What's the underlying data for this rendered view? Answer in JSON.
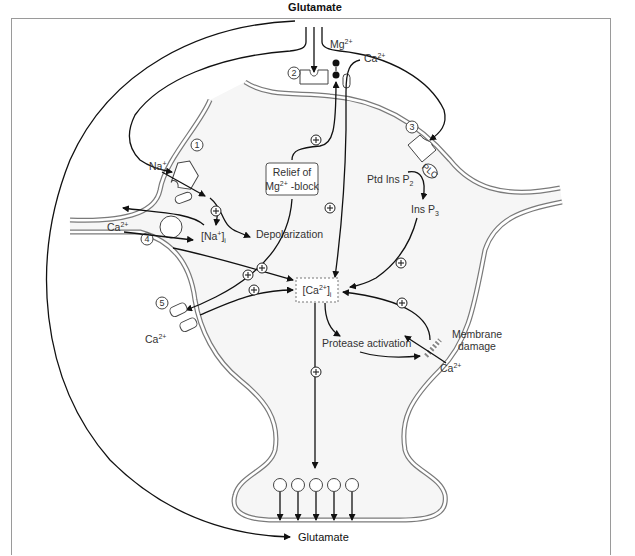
{
  "labels": {
    "glutamate_top": "Glutamate",
    "glutamate_bottom": "Glutamate",
    "mg": "Mg",
    "mg_sup": "2+",
    "ca_top": "Ca",
    "ca_top_sup": "2+",
    "na": "Na",
    "na_sup": "+",
    "relief_line1": "Relief of",
    "relief_line2_a": "Mg",
    "relief_line2_sup": "2+",
    "relief_line2_b": " -block",
    "depolarization": "Depolarization",
    "na_i": "[Na",
    "na_i_sup": "+",
    "na_i_end": "]",
    "na_i_sub": "i",
    "ca_left": "Ca",
    "ca_left_sup": "2+",
    "ca_i": "[Ca",
    "ca_i_sup": "2+",
    "ca_i_end": "]",
    "ca_i_sub": "i",
    "ca_bottom_left": "Ca",
    "ca_bottom_left_sup": "2+",
    "ptd_ins": "Ptd Ins P",
    "ptd_ins_sub": "2",
    "ins_p3": "Ins P",
    "ins_p3_sub": "3",
    "plc": "PLC",
    "protease": "Protease activation",
    "membrane_damage_1": "Membrane",
    "membrane_damage_2": "damage",
    "ca_right": "Ca",
    "ca_right_sup": "2+"
  },
  "receptors": [
    {
      "id": "1",
      "label": "1",
      "name": "AMPA/kainate receptor"
    },
    {
      "id": "2",
      "label": "2",
      "name": "NMDA receptor"
    },
    {
      "id": "3",
      "label": "3",
      "name": "metabotropic receptor"
    },
    {
      "id": "4",
      "label": "4",
      "name": "Na/Ca exchanger"
    },
    {
      "id": "5",
      "label": "5",
      "name": "voltage-gated Ca channel"
    }
  ],
  "plus_sign": "+",
  "colors": {
    "membrane": "#7a7a7a",
    "cytoplasm": "#f6f6f6",
    "line": "#111111",
    "frame": "#9a9a9a"
  }
}
